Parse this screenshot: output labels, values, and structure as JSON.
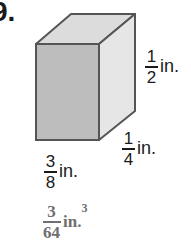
{
  "problem": {
    "number_label": "9."
  },
  "figure": {
    "shape": "rectangular-prism",
    "colors": {
      "front": "#bdbdbd",
      "top": "#dcdcdc",
      "side": "#e6e6e6",
      "edge": "#555555"
    }
  },
  "dimensions": {
    "height": {
      "numerator": "1",
      "denominator": "2",
      "unit": "in."
    },
    "depth": {
      "numerator": "1",
      "denominator": "4",
      "unit": "in."
    },
    "width": {
      "numerator": "3",
      "denominator": "8",
      "unit": "in."
    }
  },
  "answer": {
    "numerator": "3",
    "denominator": "64",
    "unit": "in.",
    "exponent": "3"
  }
}
